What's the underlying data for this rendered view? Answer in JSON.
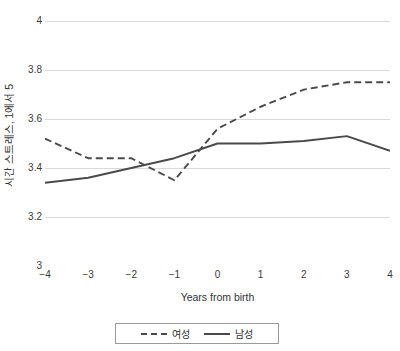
{
  "chart_data": {
    "type": "line",
    "title": "",
    "xlabel": "Years from birth",
    "ylabel": "시간 스트레스, 1에서 5",
    "x": [
      -4,
      -3,
      -2,
      -1,
      0,
      1,
      2,
      3,
      4
    ],
    "xtick_labels": [
      "−4",
      "−3",
      "−2",
      "−1",
      "0",
      "1",
      "2",
      "3",
      "4"
    ],
    "ytick_labels": [
      "3",
      "3.2",
      "3.4",
      "3.6",
      "3.8",
      "4"
    ],
    "ytick_values": [
      3,
      3.2,
      3.4,
      3.6,
      3.8,
      4
    ],
    "xlim": [
      -4,
      4
    ],
    "ylim": [
      3,
      4
    ],
    "grid": "horizontal",
    "legend_position": "bottom",
    "series": [
      {
        "name": "여성",
        "style": "dashed",
        "color": "#4a4a4a",
        "values": [
          3.52,
          3.44,
          3.44,
          3.35,
          3.56,
          3.65,
          3.72,
          3.75,
          3.75
        ]
      },
      {
        "name": "남성",
        "style": "solid",
        "color": "#4a4a4a",
        "values": [
          3.34,
          3.36,
          3.4,
          3.44,
          3.5,
          3.5,
          3.51,
          3.53,
          3.47
        ]
      }
    ],
    "colors": {
      "gridline": "#d9d9d9",
      "axis": "#8c8c8c",
      "line": "#4a4a4a",
      "text": "#3a3a3a",
      "background": "#ffffff"
    }
  },
  "legend": {
    "items": [
      {
        "label": "여성",
        "style": "dashed"
      },
      {
        "label": "남성",
        "style": "solid"
      }
    ]
  },
  "axes": {
    "x_title": "Years from birth",
    "y_title": "시간 스트레스, 1에서 5"
  }
}
